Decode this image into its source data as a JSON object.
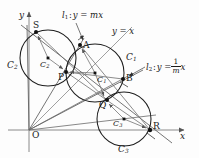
{
  "figure": {
    "type": "geometry-diagram",
    "width": 199,
    "height": 158,
    "axes": {
      "x_label": "x",
      "y_label": "y",
      "origin_label": "O",
      "x_axis_y": 130,
      "y_axis_x": 29
    },
    "points": [
      {
        "id": "S",
        "label": "S",
        "x": 36,
        "y": 32
      },
      {
        "id": "A",
        "label": "A",
        "x": 80,
        "y": 45
      },
      {
        "id": "P",
        "label": "P",
        "x": 66,
        "y": 72
      },
      {
        "id": "B",
        "label": "B",
        "x": 123,
        "y": 79
      },
      {
        "id": "Q",
        "label": "Q",
        "x": 106,
        "y": 100
      },
      {
        "id": "R",
        "label": "R",
        "x": 150,
        "y": 130
      },
      {
        "id": "O",
        "label": "O",
        "x": 29,
        "y": 130
      }
    ],
    "circles": [
      {
        "id": "C1",
        "outer_label": "C",
        "outer_sub": "1",
        "center_label": "C",
        "center_sub": "1",
        "cx": 95,
        "cy": 73,
        "r": 29,
        "center_dot_x": 95,
        "center_dot_y": 73,
        "outer_label_x": 126,
        "outer_label_y": 58
      },
      {
        "id": "C2",
        "outer_label": "C",
        "outer_sub": "2",
        "center_label": "C",
        "center_sub": "2",
        "cx": 48,
        "cy": 58,
        "r": 28,
        "center_dot_x": 48,
        "center_dot_y": 58,
        "outer_label_x": 8,
        "outer_label_y": 66
      },
      {
        "id": "C3",
        "outer_label": "C",
        "outer_sub": "3",
        "center_label": "C",
        "center_sub": "3",
        "cx": 124,
        "cy": 119,
        "r": 27,
        "center_dot_x": 124,
        "center_dot_y": 119,
        "outer_label_x": 119,
        "outer_label_y": 150
      }
    ],
    "lines": [
      {
        "id": "l1",
        "label_prefix": "l",
        "label_sub": "1",
        "equation": "y = mx",
        "label_x": 63,
        "label_y": 14
      },
      {
        "id": "yx",
        "label_prefix": "",
        "label_sub": "",
        "equation": "y = x",
        "label_x": 113,
        "label_y": 30
      },
      {
        "id": "l2",
        "label_prefix": "l",
        "label_sub": "2",
        "equation_lead": "y =",
        "equation_num": "1",
        "equation_den": "m",
        "equation_tail": "x",
        "label_x": 148,
        "label_y": 62
      }
    ],
    "radii_marks": [
      {
        "from": "C2",
        "to": "S"
      },
      {
        "from": "C2",
        "to": "P"
      },
      {
        "from": "C1",
        "to": "A"
      },
      {
        "from": "C1",
        "to": "P"
      },
      {
        "from": "C1",
        "to": "Q"
      },
      {
        "from": "C3",
        "to": "Q"
      },
      {
        "from": "C3",
        "to": "R"
      }
    ]
  }
}
